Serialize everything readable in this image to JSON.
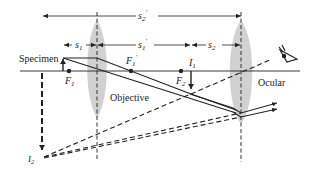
{
  "diagram": {
    "type": "compound-microscope-ray-diagram",
    "colors": {
      "line": "#222222",
      "lens_fill": "#c8c8c8",
      "background": "#ffffff"
    },
    "labels": {
      "specimen": "Specimen",
      "objective": "Objective",
      "ocular": "Ocular"
    },
    "points": {
      "F1": {
        "base": "F",
        "sub": "1",
        "prime": ""
      },
      "F1_prime": {
        "base": "F",
        "sub": "1",
        "prime": "′"
      },
      "F2": {
        "base": "F",
        "sub": "2",
        "prime": ""
      },
      "I1": {
        "base": "I",
        "sub": "1",
        "prime": ""
      },
      "I2": {
        "base": "I",
        "sub": "2",
        "prime": ""
      }
    },
    "distances": {
      "s1": {
        "base": "s",
        "sub": "1",
        "prime": ""
      },
      "s1_prime": {
        "base": "s",
        "sub": "1",
        "prime": "′"
      },
      "s2": {
        "base": "s",
        "sub": "2",
        "prime": ""
      },
      "s2_prime": {
        "base": "s",
        "sub": "2",
        "prime": "′"
      }
    },
    "icons": {
      "eye": "eye-icon"
    }
  }
}
